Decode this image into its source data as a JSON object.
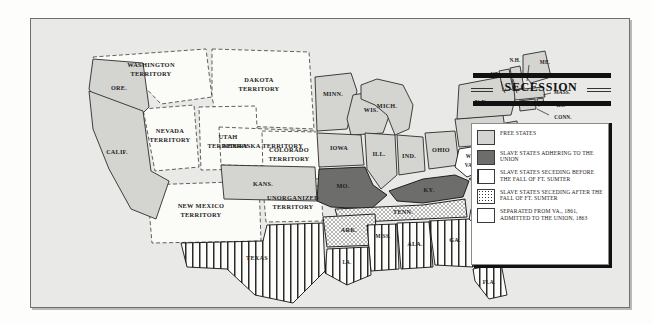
{
  "map": {
    "title": "SECESSION",
    "background_color": "#e9e9e7",
    "legend": {
      "items": [
        {
          "key": "free",
          "swatch": "light-gray-fill",
          "label": "FREE STATES"
        },
        {
          "key": "adhere",
          "swatch": "dark-gray-fill",
          "label": "SLAVE STATES ADHERING TO THE UNION"
        },
        {
          "key": "before",
          "swatch": "vertical-stripes",
          "label": "SLAVE STATES SECEDING BEFORE THE FALL OF FT. SUMTER"
        },
        {
          "key": "after",
          "swatch": "stippled-dots",
          "label": "SLAVE STATES SECEDING AFTER THE FALL OF FT. SUMTER"
        },
        {
          "key": "sep",
          "swatch": "white-fill",
          "label": "SEPARATED FROM VA., 1861, ADMITTED TO THE UNION, 1863"
        }
      ]
    },
    "colors": {
      "free_states": "#d4d4d1",
      "slave_union": "#6d6d6b",
      "seceding_before": "#ffffff",
      "seceding_after": "#ffffff",
      "separated": "#ffffff",
      "territory": "#fbfbf8",
      "outline": "#2b2b2b"
    },
    "regions": [
      {
        "name": "WASHINGTON TERRITORY",
        "label": "WASHINGTON\nTERRITORY",
        "category": "territory"
      },
      {
        "name": "ORE.",
        "label": "ORE.",
        "category": "free"
      },
      {
        "name": "CALIF.",
        "label": "CALIF.",
        "category": "free"
      },
      {
        "name": "NEVADA TERRITORY",
        "label": "NEVADA\nTERRITORY",
        "category": "territory"
      },
      {
        "name": "UTAH TERRITORY",
        "label": "UTAH\nTERRITORY",
        "category": "territory"
      },
      {
        "name": "DAKOTA TERRITORY",
        "label": "DAKOTA\nTERRITORY",
        "category": "territory"
      },
      {
        "name": "NEBRASKA TERRITORY",
        "label": "NEBRASKA TERRITORY",
        "category": "territory"
      },
      {
        "name": "COLORADO TERRITORY",
        "label": "COLORADO\nTERRITORY",
        "category": "territory"
      },
      {
        "name": "NEW MEXICO TERRITORY",
        "label": "NEW MEXICO\nTERRITORY",
        "category": "territory"
      },
      {
        "name": "UNORGANIZED TERRITORY",
        "label": "UNORGANIZED\nTERRITORY",
        "category": "territory"
      },
      {
        "name": "KANS.",
        "label": "KANS.",
        "category": "free"
      },
      {
        "name": "MINN.",
        "label": "MINN.",
        "category": "free"
      },
      {
        "name": "WIS.",
        "label": "WIS.",
        "category": "free"
      },
      {
        "name": "IOWA",
        "label": "IOWA",
        "category": "free"
      },
      {
        "name": "ILL.",
        "label": "ILL.",
        "category": "free"
      },
      {
        "name": "MICH.",
        "label": "MICH.",
        "category": "free"
      },
      {
        "name": "IND.",
        "label": "IND.",
        "category": "free"
      },
      {
        "name": "OHIO",
        "label": "OHIO",
        "category": "free"
      },
      {
        "name": "PA.",
        "label": "PA.",
        "category": "free"
      },
      {
        "name": "N.Y.",
        "label": "N.Y.",
        "category": "free"
      },
      {
        "name": "VT.",
        "label": "VT.",
        "category": "free"
      },
      {
        "name": "N.H.",
        "label": "N.H.",
        "category": "free"
      },
      {
        "name": "ME.",
        "label": "ME.",
        "category": "free"
      },
      {
        "name": "MASS.",
        "label": "MASS.",
        "category": "free"
      },
      {
        "name": "R.I.",
        "label": "R.I.",
        "category": "free"
      },
      {
        "name": "CONN.",
        "label": "CONN.",
        "category": "free"
      },
      {
        "name": "N.J.",
        "label": "N.J.",
        "category": "free"
      },
      {
        "name": "MO.",
        "label": "MO.",
        "category": "adhere"
      },
      {
        "name": "KY.",
        "label": "KY.",
        "category": "adhere"
      },
      {
        "name": "DEL.",
        "label": "DEL.",
        "category": "adhere"
      },
      {
        "name": "MD.",
        "label": "MD.",
        "category": "adhere"
      },
      {
        "name": "W. VA.",
        "label": "W.\nVA.",
        "category": "separated"
      },
      {
        "name": "VA.",
        "label": "VA.",
        "category": "after"
      },
      {
        "name": "N.C.",
        "label": "N.C.",
        "category": "after"
      },
      {
        "name": "TENN.",
        "label": "TENN.",
        "category": "after"
      },
      {
        "name": "ARK.",
        "label": "ARK.",
        "category": "after"
      },
      {
        "name": "S.C.",
        "label": "S.C.",
        "category": "before"
      },
      {
        "name": "GA.",
        "label": "GA.",
        "category": "before"
      },
      {
        "name": "FLA.",
        "label": "FLA.",
        "category": "before"
      },
      {
        "name": "ALA.",
        "label": "ALA.",
        "category": "before"
      },
      {
        "name": "MISS.",
        "label": "MISS.",
        "category": "before"
      },
      {
        "name": "LA.",
        "label": "LA.",
        "category": "before"
      },
      {
        "name": "TEXAS",
        "label": "TEXAS",
        "category": "before"
      }
    ]
  }
}
